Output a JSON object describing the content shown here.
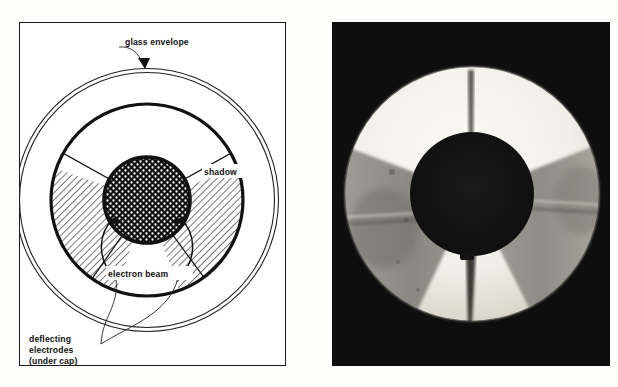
{
  "figure": {
    "panels": [
      {
        "id": "diagram",
        "kind": "line-diagram",
        "caption": ""
      },
      {
        "id": "photograph",
        "kind": "monochrome-photograph",
        "caption": ""
      }
    ]
  },
  "diagram": {
    "background_color": "#ffffff",
    "line_color": "#111111",
    "frame": {
      "visible": true,
      "stroke_width": 1.6
    },
    "labels": {
      "glass_envelope": "glass envelope",
      "shadow": "shadow",
      "electron_beam": "electron beam",
      "deflecting_electrodes_line1": "deflecting",
      "deflecting_electrodes_line2": "electrodes",
      "deflecting_electrodes_line3": "(under cap)"
    },
    "parts": [
      {
        "name": "glass envelope",
        "shape": "double-line outer circle"
      },
      {
        "name": "inner screen circle",
        "shape": "heavy circle"
      },
      {
        "name": "shadow sectors",
        "shape": "hatched sectors",
        "count": 2
      },
      {
        "name": "illuminated sectors",
        "shape": "white sectors",
        "count": 2
      },
      {
        "name": "cap / electron beam source",
        "shape": "stippled dark disc"
      },
      {
        "name": "deflecting electrodes",
        "shape": "curved arrow pair",
        "count": 2
      }
    ]
  },
  "photograph": {
    "background_color": "#0e0e0e",
    "description": "Circular glowing annulus with dark wedge shadows and a dark central cap",
    "bright_ring_color": "#f2f0ea",
    "shadow_wedge_color": "#8d8a84",
    "center_cap_color": "#141414"
  },
  "colors": {
    "ink": "#111111",
    "paper": "#ffffff",
    "photo_black": "#0e0e0e",
    "photo_white": "#f2f0ea"
  }
}
